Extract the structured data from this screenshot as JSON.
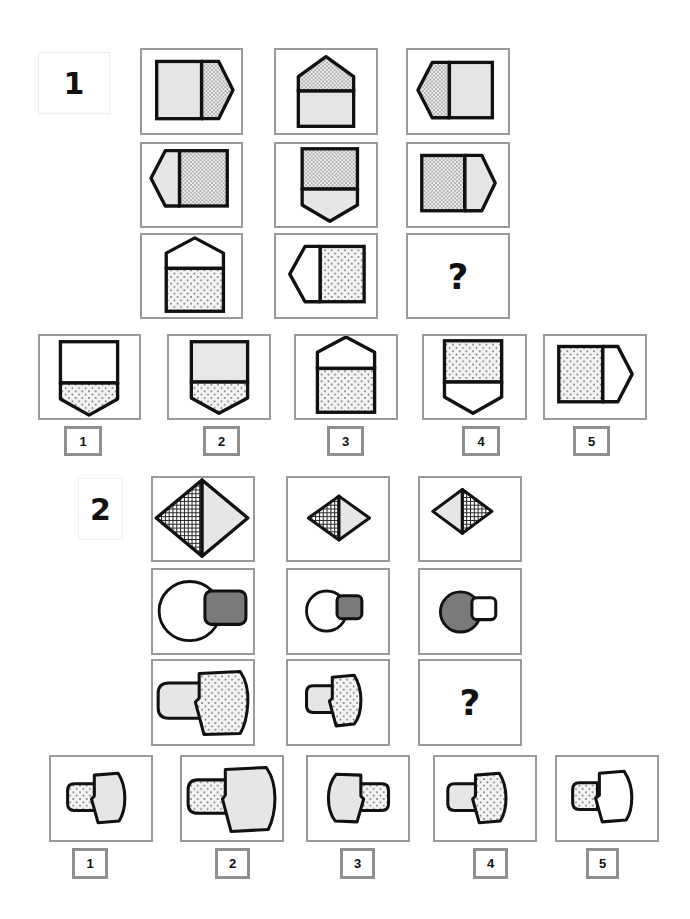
{
  "puzzle1": {
    "label": "1",
    "question_mark": "?",
    "grid": [
      [
        "pentagon-right-light-square-dotted-point",
        "pentagon-up-dotted-point-light-square",
        "pentagon-left-dotted-point-light-square"
      ],
      [
        "pentagon-left-light-point-dotted-square",
        "pentagon-down-dotted-square-light-point",
        "pentagon-right-dotted-square-light-point"
      ],
      [
        "pentagon-up-white-point-dotted-square",
        "pentagon-left-white-point-dotted-square",
        "missing"
      ]
    ],
    "options": [
      {
        "number": "1",
        "shape": "pentagon-down-white-square-dotted-point"
      },
      {
        "number": "2",
        "shape": "pentagon-down-light-square-dotted-point"
      },
      {
        "number": "3",
        "shape": "pentagon-up-white-point-dotted-square"
      },
      {
        "number": "4",
        "shape": "pentagon-down-dotted-square-white-point"
      },
      {
        "number": "5",
        "shape": "pentagon-right-dotted-square-white-point"
      }
    ]
  },
  "puzzle2": {
    "label": "2",
    "question_mark": "?",
    "grid": [
      [
        "large-diamond-hatched-left-light-right",
        "small-diamond-hatched-left-light-right",
        "small-diamond-light-left-hatched-right"
      ],
      [
        "large-circle-white-with-gray-square",
        "small-circle-white-with-gray-square",
        "small-circle-gray-with-white-square"
      ],
      [
        "large-stub-light-with-dotted-head",
        "small-stub-light-with-dotted-head",
        "missing"
      ]
    ],
    "options": [
      {
        "number": "1",
        "shape": "small-stub-dotted-with-light-head"
      },
      {
        "number": "2",
        "shape": "large-stub-dotted-with-light-head"
      },
      {
        "number": "3",
        "shape": "small-mirrored-light-head-dotted-stub"
      },
      {
        "number": "4",
        "shape": "small-stub-light-with-dotted-head"
      },
      {
        "number": "5",
        "shape": "small-stub-dotted-with-white-head"
      }
    ]
  },
  "colors": {
    "border_gray": "#9a9a9a",
    "light_fill": "#e6e6e6",
    "dark_fill": "#7a7a7a",
    "stroke": "#111111"
  }
}
